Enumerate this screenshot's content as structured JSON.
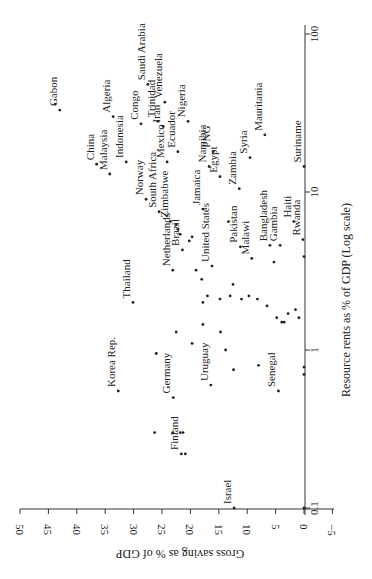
{
  "chart_data": {
    "type": "scatter",
    "orientation_note": "figure rotated 90 degrees counterclockwise",
    "title": "",
    "xlabel": "Resource rents as % of GDP (Log scale)",
    "ylabel": "Gross saving as % of GDP",
    "x_scale": "log",
    "xlim": [
      0.1,
      100
    ],
    "ylim": [
      -5,
      50
    ],
    "x_ticks": [
      "0.1",
      "1",
      "10",
      "100"
    ],
    "y_ticks": [
      "50",
      "45",
      "40",
      "35",
      "30",
      "25",
      "20",
      "15",
      "10",
      "5",
      "0",
      "-5"
    ],
    "grid": false,
    "points": [
      {
        "label": "Gabon",
        "x": 33,
        "y": 43
      },
      {
        "label": "",
        "x": 36,
        "y": 43.8
      },
      {
        "label": "China",
        "x": 15,
        "y": 36.5
      },
      {
        "label": "Malaysia",
        "x": 13,
        "y": 34.2
      },
      {
        "label": "Indonesia",
        "x": 15.5,
        "y": 31.3
      },
      {
        "label": "Algeria",
        "x": 30,
        "y": 33.6
      },
      {
        "label": "Congo",
        "x": 27,
        "y": 28.7
      },
      {
        "label": "Saudi Arabia",
        "x": 48,
        "y": 27.5
      },
      {
        "label": "Venezuela",
        "x": 37,
        "y": 24.5
      },
      {
        "label": "Trinidad",
        "x": 28,
        "y": 25.7
      },
      {
        "label": "Iran",
        "x": 26,
        "y": 24.8
      },
      {
        "label": "Nigeria",
        "x": 28,
        "y": 20.4
      },
      {
        "label": "Ecuador",
        "x": 18,
        "y": 22.2
      },
      {
        "label": "Mexico",
        "x": 15.5,
        "y": 24.1
      },
      {
        "label": "Norway",
        "x": 9,
        "y": 27.8
      },
      {
        "label": "South Africa",
        "x": 7.5,
        "y": 25.5
      },
      {
        "label": "Zimbabwe",
        "x": 6.5,
        "y": 23.5
      },
      {
        "label": "",
        "x": 6.2,
        "y": 22.5
      },
      {
        "label": "",
        "x": 5.8,
        "y": 22.2
      },
      {
        "label": "",
        "x": 5.4,
        "y": 21.8
      },
      {
        "label": "Netherlands",
        "x": 3.2,
        "y": 23.1
      },
      {
        "label": "Brazil",
        "x": 4.3,
        "y": 21.4
      },
      {
        "label": "",
        "x": 4.9,
        "y": 20.2
      },
      {
        "label": "",
        "x": 5.2,
        "y": 19.7
      },
      {
        "label": "Thailand",
        "x": 2.0,
        "y": 30.1
      },
      {
        "label": "Jamaica",
        "x": 7.8,
        "y": 17.8
      },
      {
        "label": "United States",
        "x": 3.4,
        "y": 16.2
      },
      {
        "label": "",
        "x": 3.2,
        "y": 19.0
      },
      {
        "label": "",
        "x": 2.8,
        "y": 18.0
      },
      {
        "label": "PNG",
        "x": 18,
        "y": 16.0
      },
      {
        "label": "Namibia",
        "x": 14.5,
        "y": 16.7
      },
      {
        "label": "Egypt",
        "x": 12.5,
        "y": 14.8
      },
      {
        "label": "Zambia",
        "x": 10.5,
        "y": 11.4
      },
      {
        "label": "Syria",
        "x": 16.5,
        "y": 9.5
      },
      {
        "label": "Mauritania",
        "x": 23,
        "y": 6.9
      },
      {
        "label": "Pakistan",
        "x": 4.5,
        "y": 11.2
      },
      {
        "label": "",
        "x": 6.5,
        "y": 13.3
      },
      {
        "label": "Malawi",
        "x": 3.8,
        "y": 9.2
      },
      {
        "label": "",
        "x": 2.6,
        "y": 12.5
      },
      {
        "label": "Bangladesh",
        "x": 4.6,
        "y": 6.0
      },
      {
        "label": "Gambia",
        "x": 4.6,
        "y": 4.2
      },
      {
        "label": "",
        "x": 3.6,
        "y": 5.3
      },
      {
        "label": "Haiti",
        "x": 6.5,
        "y": 1.8
      },
      {
        "label": "Rwanda",
        "x": 5.0,
        "y": 0.2
      },
      {
        "label": "Suriname",
        "x": 14.5,
        "y": 0.0
      },
      {
        "label": "",
        "x": 3.9,
        "y": 0.0
      },
      {
        "label": "",
        "x": 2.0,
        "y": 17.8
      },
      {
        "label": "",
        "x": 2.2,
        "y": 17.0
      },
      {
        "label": "",
        "x": 2.1,
        "y": 14.8
      },
      {
        "label": "",
        "x": 2.2,
        "y": 13.0
      },
      {
        "label": "",
        "x": 2.1,
        "y": 11.0
      },
      {
        "label": "",
        "x": 2.2,
        "y": 9.7
      },
      {
        "label": "",
        "x": 2.1,
        "y": 8.2
      },
      {
        "label": "",
        "x": 1.9,
        "y": 6.5
      },
      {
        "label": "",
        "x": 1.6,
        "y": 4.8
      },
      {
        "label": "",
        "x": 1.5,
        "y": 3.9
      },
      {
        "label": "",
        "x": 1.5,
        "y": 3.5
      },
      {
        "label": "",
        "x": 1.7,
        "y": 2.8
      },
      {
        "label": "",
        "x": 1.8,
        "y": 1.5
      },
      {
        "label": "",
        "x": 1.6,
        "y": 0.9
      },
      {
        "label": "",
        "x": 1.3,
        "y": 22.5
      },
      {
        "label": "",
        "x": 1.45,
        "y": 17.8
      },
      {
        "label": "",
        "x": 1.3,
        "y": 14.7
      },
      {
        "label": "",
        "x": 1.1,
        "y": 19.7
      },
      {
        "label": "",
        "x": 1.0,
        "y": 13.8
      },
      {
        "label": "",
        "x": 0.75,
        "y": 12.4
      },
      {
        "label": "Korea Rep.",
        "x": 0.55,
        "y": 32.7
      },
      {
        "label": "Germany",
        "x": 0.5,
        "y": 23.0
      },
      {
        "label": "Uruguay",
        "x": 0.6,
        "y": 16.4
      },
      {
        "label": "Senegal",
        "x": 0.55,
        "y": 4.5
      },
      {
        "label": "",
        "x": 0.95,
        "y": 26.0
      },
      {
        "label": "",
        "x": 0.8,
        "y": 8.0
      },
      {
        "label": "",
        "x": 0.7,
        "y": 0.0
      },
      {
        "label": "",
        "x": 0.78,
        "y": 0.0
      },
      {
        "label": "",
        "x": 0.3,
        "y": 26.3
      },
      {
        "label": "",
        "x": 0.3,
        "y": 23.1
      },
      {
        "label": "",
        "x": 0.3,
        "y": 21.8
      },
      {
        "label": "",
        "x": 0.3,
        "y": 21.3
      },
      {
        "label": "Finland",
        "x": 0.22,
        "y": 21.6
      },
      {
        "label": "",
        "x": 0.22,
        "y": 20.9
      },
      {
        "label": "Israel",
        "x": 0.1,
        "y": 12.3
      },
      {
        "label": "",
        "x": 0.1,
        "y": 0.0
      }
    ]
  },
  "axes": {
    "y_axis_title": "Gross saving as % of GDP",
    "x_axis_title": "Resource rents as % of GDP (Log scale)",
    "y_tick_labels": [
      "50",
      "45",
      "40",
      "35",
      "30",
      "25",
      "20",
      "15",
      "10",
      "5",
      "0",
      "−5"
    ],
    "x_tick_labels": [
      "0.1",
      "1",
      "10",
      "100"
    ]
  }
}
